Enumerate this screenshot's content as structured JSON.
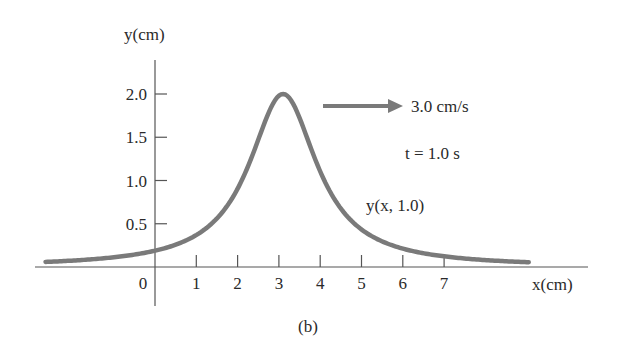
{
  "chart_data": {
    "type": "line",
    "title": "",
    "caption": "(b)",
    "xlabel": "x(cm)",
    "ylabel": "y(cm)",
    "x_ticks": [
      "0",
      "1",
      "2",
      "3",
      "4",
      "5",
      "6",
      "7"
    ],
    "y_ticks": [
      "0.5",
      "1.0",
      "1.5",
      "2.0"
    ],
    "xlim": [
      -3.0,
      9.0
    ],
    "ylim": [
      0,
      2.5
    ],
    "grid": false,
    "legend": null,
    "series": [
      {
        "name": "y(x, 1.0)",
        "function": "y = 2 / ((x - 3)^2 + 1)",
        "x": [
          -2.8,
          -2,
          -1,
          0,
          1,
          2,
          2.5,
          3,
          3.5,
          4,
          5,
          6,
          7,
          8,
          9
        ],
        "values": [
          0.06,
          0.08,
          0.12,
          0.2,
          0.4,
          1.0,
          1.6,
          2.0,
          1.6,
          1.0,
          0.4,
          0.2,
          0.12,
          0.08,
          0.06
        ]
      }
    ],
    "annotations": [
      {
        "text": "3.0 cm/s",
        "type": "arrow-right",
        "meaning": "wave velocity"
      },
      {
        "text": "t = 1.0 s"
      },
      {
        "text": "y(x, 1.0)",
        "target": "curve"
      }
    ],
    "colors": {
      "curve": "#7a7a7a",
      "arrow": "#7a7a7a",
      "axis": "#555555",
      "text": "#2a2a2a"
    }
  },
  "labels": {
    "y_axis": "y(cm)",
    "x_axis": "x(cm)",
    "speed": "3.0 cm/s",
    "time": "t = 1.0 s",
    "curve": "y(x, 1.0)",
    "caption": "(b)"
  }
}
